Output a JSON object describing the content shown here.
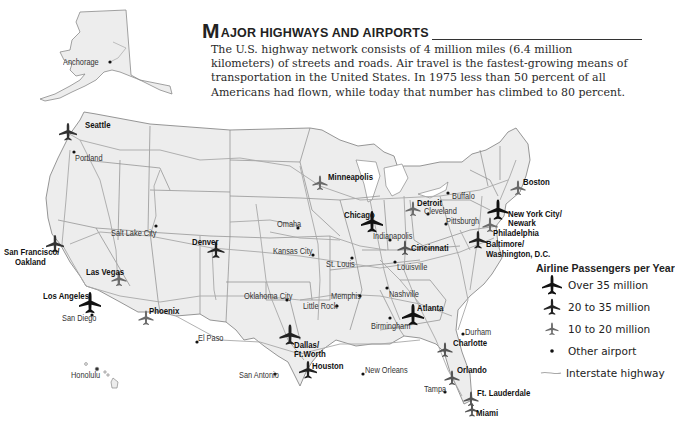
{
  "header": {
    "title_initial": "M",
    "title_rest": "AJOR HIGHWAYS AND AIRPORTS",
    "description": "The U.S. highway network consists of 4 million miles (6.4 million kilometers) of streets and roads. Air travel is the fastest-growing means of transportation in the United States. In 1975 less than 50 percent of all Americans had flown, while today that number has climbed to 80 percent."
  },
  "legend": {
    "title": "Airline Passengers per Year",
    "items": [
      {
        "icon": "airplane-large-icon",
        "label": "Over 35 million"
      },
      {
        "icon": "airplane-medium-icon",
        "label": "20 to 35 million"
      },
      {
        "icon": "airplane-small-icon",
        "label": "10 to 20 million"
      },
      {
        "icon": "dot-icon",
        "label": "Other airport"
      },
      {
        "icon": "highway-line-icon",
        "label": "Interstate highway"
      }
    ]
  },
  "airports_major": [
    {
      "name": "Seattle",
      "tier": "medium"
    },
    {
      "name": "San Francisco/ Oakland",
      "tier": "medium"
    },
    {
      "name": "Las Vegas",
      "tier": "small"
    },
    {
      "name": "Los Angeles",
      "tier": "large"
    },
    {
      "name": "Phoenix",
      "tier": "small"
    },
    {
      "name": "Denver",
      "tier": "medium"
    },
    {
      "name": "Minneapolis",
      "tier": "small"
    },
    {
      "name": "Chicago",
      "tier": "large"
    },
    {
      "name": "Dallas/ Ft.Worth",
      "tier": "large"
    },
    {
      "name": "Houston",
      "tier": "medium"
    },
    {
      "name": "Detroit",
      "tier": "small"
    },
    {
      "name": "Cincinnati",
      "tier": "small"
    },
    {
      "name": "Atlanta",
      "tier": "large"
    },
    {
      "name": "Charlotte",
      "tier": "small"
    },
    {
      "name": "New York City/ Newark",
      "tier": "large"
    },
    {
      "name": "Boston",
      "tier": "small"
    },
    {
      "name": "Philadelphia",
      "tier": "small"
    },
    {
      "name": "Baltimore/ Washington, D.C.",
      "tier": "medium"
    },
    {
      "name": "Orlando",
      "tier": "small"
    },
    {
      "name": "Ft. Lauderdale",
      "tier": "small"
    },
    {
      "name": "Miami",
      "tier": "small"
    }
  ],
  "airports_other": [
    "Anchorage",
    "Portland",
    "Salt Lake City",
    "San Diego",
    "El Paso",
    "Honolulu",
    "Omaha",
    "Kansas City",
    "St. Louis",
    "Oklahoma City",
    "Little Rock",
    "Memphis",
    "Indianapolis",
    "Louisville",
    "Nashville",
    "Birmingham",
    "San Antonio",
    "New Orleans",
    "Tampa",
    "Cleveland",
    "Pittsburgh",
    "Buffalo",
    "Durham"
  ],
  "labels": {
    "anchorage": "Anchorage",
    "seattle": "Seattle",
    "portland": "Portland",
    "salt_lake": "Salt Lake City",
    "sf1": "San Francisco/",
    "sf2": "Oakland",
    "vegas": "Las Vegas",
    "la": "Los Angeles",
    "sandiego": "San Diego",
    "phoenix": "Phoenix",
    "elpaso": "El Paso",
    "honolulu": "Honolulu",
    "denver": "Denver",
    "minneapolis": "Minneapolis",
    "omaha": "Omaha",
    "kc": "Kansas City",
    "stl": "St. Louis",
    "chicago": "Chicago",
    "indy": "Indianapolis",
    "okc": "Oklahoma City",
    "littlerock": "Little Rock",
    "memphis": "Memphis",
    "dfw1": "Dallas/",
    "dfw2": "Ft.Worth",
    "houston": "Houston",
    "sanantonio": "San Antonio",
    "neworleans": "New Orleans",
    "detroit": "Detroit",
    "cleveland": "Cleveland",
    "pittsburgh": "Pittsburgh",
    "buffalo": "Buffalo",
    "boston": "Boston",
    "nyc1": "New York City/",
    "nyc2": "Newark",
    "philly": "Philadelphia",
    "bw1": "Baltimore/",
    "bw2": "Washington, D.C.",
    "cincy": "Cincinnati",
    "louisville": "Louisville",
    "nashville": "Nashville",
    "durham": "Durham",
    "charlotte": "Charlotte",
    "atlanta": "Atlanta",
    "birmingham": "Birmingham",
    "orlando": "Orlando",
    "tampa": "Tampa",
    "ftl": "Ft. Lauderdale",
    "miami": "Miami"
  },
  "colors": {
    "land": "#ededed",
    "border": "#8a8a8a",
    "highway": "#a8a8a8",
    "plane_large": "#111111",
    "plane_medium": "#333333",
    "plane_small": "#6a6a6a"
  }
}
